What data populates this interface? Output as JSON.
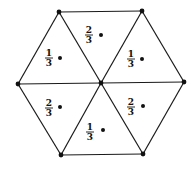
{
  "diagram": {
    "type": "hexagon-triangulation",
    "vertices": {
      "top_left": [
        59,
        12
      ],
      "top_right": [
        142,
        11
      ],
      "right": [
        184,
        82
      ],
      "bottom_right": [
        143,
        154
      ],
      "bottom_left": [
        61,
        155
      ],
      "left": [
        18,
        84
      ],
      "center": [
        101,
        83
      ]
    },
    "triangles": [
      {
        "position": "top",
        "numerator": "2",
        "denominator": "3",
        "label": "2/3",
        "label_xy": [
          89,
          37
        ],
        "dot_xy": [
          101,
          35
        ]
      },
      {
        "position": "upper-right",
        "numerator": "1",
        "denominator": "3",
        "label": "1/3",
        "label_xy": [
          131,
          60
        ],
        "dot_xy": [
          142,
          59
        ]
      },
      {
        "position": "lower-right",
        "numerator": "2",
        "denominator": "3",
        "label": "2/3",
        "label_xy": [
          131,
          109
        ],
        "dot_xy": [
          143,
          106
        ]
      },
      {
        "position": "bottom",
        "numerator": "1",
        "denominator": "3",
        "label": "1/3",
        "label_xy": [
          90,
          134
        ],
        "dot_xy": [
          103,
          130
        ]
      },
      {
        "position": "lower-left",
        "numerator": "2",
        "denominator": "3",
        "label": "2/3",
        "label_xy": [
          49,
          109
        ],
        "dot_xy": [
          60,
          107
        ]
      },
      {
        "position": "upper-left",
        "numerator": "1",
        "denominator": "3",
        "label": "1/3",
        "label_xy": [
          49,
          60
        ],
        "dot_xy": [
          60,
          58
        ]
      }
    ],
    "colors": {
      "line": "#1a1a1a",
      "background": "#ffffff"
    }
  }
}
